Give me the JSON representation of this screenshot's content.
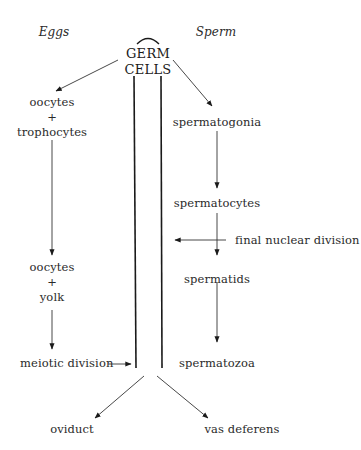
{
  "diagram": {
    "headers": {
      "left": "Eggs",
      "right": "Sperm"
    },
    "center": {
      "line1": "GERM",
      "line2": "CELLS"
    },
    "egg_path": {
      "step1": {
        "line1": "oocytes",
        "plus": "+",
        "line2": "trophocytes"
      },
      "step2": {
        "line1": "oocytes",
        "plus": "+",
        "line2": "yolk"
      },
      "step3": "meiotic division",
      "exit": "oviduct"
    },
    "sperm_path": {
      "step1": "spermatogonia",
      "step2": "spermatocytes",
      "annotation": "final nuclear division",
      "step3": "spermatids",
      "step4": "spermatozoa",
      "exit": "vas deferens"
    }
  }
}
